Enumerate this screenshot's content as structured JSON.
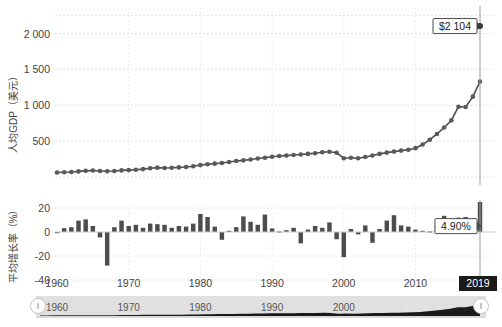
{
  "chart_data": [
    {
      "id": "gdp-per-capita",
      "type": "line",
      "title": "",
      "xlabel": "",
      "ylabel": "人均GDP（美元）",
      "ylim": [
        0,
        2300
      ],
      "xlim": [
        1960,
        2019
      ],
      "grid": true,
      "ticks_y": [
        "2 000",
        "1 500",
        "1 000",
        "500"
      ],
      "ticks_y_values": [
        2000,
        1500,
        1000,
        500
      ],
      "ticks_x": [
        "1960",
        "1970",
        "1980",
        "1990",
        "2000",
        "2010",
        "2019"
      ],
      "ticks_x_values": [
        1960,
        1970,
        1980,
        1990,
        2000,
        2010,
        2019
      ],
      "series_name": "人均GDP",
      "line_color": "#4d4d4d",
      "marker_color": "#595959",
      "x": [
        1960,
        1961,
        1962,
        1963,
        1964,
        1965,
        1966,
        1967,
        1968,
        1969,
        1970,
        1971,
        1972,
        1973,
        1974,
        1975,
        1976,
        1977,
        1978,
        1979,
        1980,
        1981,
        1982,
        1983,
        1984,
        1985,
        1986,
        1987,
        1988,
        1989,
        1990,
        1991,
        1992,
        1993,
        1994,
        1995,
        1996,
        1997,
        1998,
        1999,
        2000,
        2001,
        2002,
        2003,
        2004,
        2005,
        2006,
        2007,
        2008,
        2009,
        2010,
        2011,
        2012,
        2013,
        2014,
        2015,
        2016,
        2017,
        2018,
        2019
      ],
      "values": [
        62,
        66,
        70,
        78,
        86,
        90,
        84,
        80,
        84,
        92,
        96,
        102,
        110,
        122,
        130,
        126,
        128,
        134,
        140,
        150,
        166,
        178,
        186,
        196,
        210,
        222,
        232,
        244,
        258,
        268,
        282,
        292,
        298,
        306,
        314,
        322,
        332,
        344,
        352,
        338,
        262,
        268,
        262,
        278,
        300,
        322,
        340,
        354,
        368,
        380,
        402,
        452,
        520,
        600,
        690,
        790,
        980,
        975,
        1120,
        1330,
        1430,
        1440,
        1435,
        1490,
        1580,
        1700,
        2104
      ],
      "annotation": {
        "text": "$2 104",
        "x": 2019,
        "y": 2104
      },
      "note": "values array gives GDP per capita in USD per year"
    },
    {
      "id": "growth-rate",
      "type": "bar",
      "title": "",
      "xlabel": "",
      "ylabel": "平均增长率（%）",
      "ylim": [
        -45,
        28
      ],
      "grid": true,
      "ticks_y": [
        "20",
        "0",
        "-20",
        "-40"
      ],
      "ticks_y_values": [
        20,
        0,
        -20,
        -40
      ],
      "ticks_x": [
        "1960",
        "1970",
        "1980",
        "1990",
        "2000",
        "2010",
        "2019"
      ],
      "bar_color": "#4d4d4d",
      "categories": [
        1960,
        1961,
        1962,
        1963,
        1964,
        1965,
        1966,
        1967,
        1968,
        1969,
        1970,
        1971,
        1972,
        1973,
        1974,
        1975,
        1976,
        1977,
        1978,
        1979,
        1980,
        1981,
        1982,
        1983,
        1984,
        1985,
        1986,
        1987,
        1988,
        1989,
        1990,
        1991,
        1992,
        1993,
        1994,
        1995,
        1996,
        1997,
        1998,
        1999,
        2000,
        2001,
        2002,
        2003,
        2004,
        2005,
        2006,
        2007,
        2008,
        2009,
        2010,
        2011,
        2012,
        2013,
        2014,
        2015,
        2016,
        2017,
        2018,
        2019
      ],
      "values": [
        0,
        3.2,
        4.0,
        9.5,
        10.5,
        5.0,
        -4.5,
        -28.0,
        4.0,
        9.5,
        5.0,
        6.0,
        3.5,
        7.0,
        6.5,
        6.0,
        3.5,
        5.0,
        4.5,
        7.0,
        15.0,
        12.5,
        4.5,
        -6.5,
        1.0,
        4.0,
        13.0,
        8.5,
        6.0,
        14.5,
        3.0,
        0.5,
        1.5,
        3.5,
        -9.5,
        2.0,
        5.0,
        3.5,
        8.0,
        -6.0,
        -21.0,
        2.5,
        -2.0,
        5.5,
        -9.0,
        2.5,
        9.5,
        14.0,
        5.5,
        4.5,
        2.0,
        1.0,
        0.5,
        6.5,
        13.5,
        11.5,
        12.0,
        12.5,
        11.0,
        25.0,
        1.0,
        -5.0,
        6.0,
        20.0,
        5.0,
        0.5,
        0.5,
        4.9
      ],
      "annotation": {
        "text": "4.90%",
        "x": 2019,
        "y": 4.9
      }
    }
  ],
  "annotations": {
    "gdp_label": "$2 104",
    "growth_label": "4.90%",
    "year_badge": "2019"
  },
  "axes": {
    "top": {
      "y_title": "人均GDP（美元）",
      "y_ticks": [
        "2 000",
        "1 500",
        "1 000",
        "500"
      ]
    },
    "bottom": {
      "y_title": "平均增长率（%）",
      "y_ticks": [
        "20",
        "0",
        "-20",
        "-40"
      ],
      "x_ticks": [
        "1960",
        "1970",
        "1980",
        "1990",
        "2000",
        "2010"
      ]
    }
  },
  "navigator": {
    "x_ticks": [
      "1960",
      "1970",
      "1980",
      "1990",
      "2000",
      "2010"
    ],
    "handle_label": "",
    "track_color": "#e0e0e0",
    "series_color": "#1a1a1a"
  },
  "colors": {
    "line": "#4d4d4d",
    "bar": "#4d4d4d",
    "grid": "#e6e6e6",
    "badge_bg": "#1a1a1a",
    "text": "#444444"
  }
}
